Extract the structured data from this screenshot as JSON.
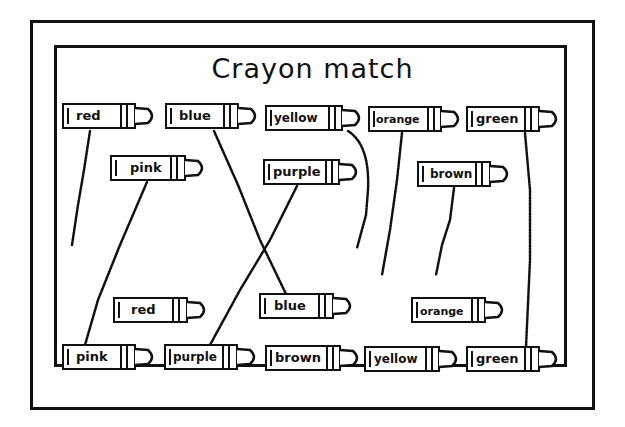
{
  "worksheet": {
    "title": "Crayon match",
    "top_row": [
      {
        "label": "red"
      },
      {
        "label": "blue"
      },
      {
        "label": "yellow"
      },
      {
        "label": "orange"
      },
      {
        "label": "green"
      }
    ],
    "second_row": [
      {
        "label": "pink"
      },
      {
        "label": "purple"
      },
      {
        "label": "brown"
      }
    ],
    "lower_row": [
      {
        "label": "red"
      },
      {
        "label": "blue"
      },
      {
        "label": "orange"
      }
    ],
    "bottom_row": [
      {
        "label": "pink"
      },
      {
        "label": "purple"
      },
      {
        "label": "brown"
      },
      {
        "label": "yellow"
      },
      {
        "label": "green"
      }
    ],
    "matches_drawn": [
      {
        "from": "blue (top)",
        "to": "blue (lower)",
        "complete": true
      },
      {
        "from": "pink (second)",
        "to": "pink (bottom)",
        "complete": true
      },
      {
        "from": "purple (second)",
        "to": "purple (bottom)",
        "complete": true
      },
      {
        "from": "green (top)",
        "to": "green (bottom)",
        "complete": true
      },
      {
        "from": "red (top)",
        "to": null,
        "complete": false
      },
      {
        "from": "yellow (top)",
        "to": null,
        "complete": false
      },
      {
        "from": "orange (top)",
        "to": null,
        "complete": false
      },
      {
        "from": "brown (second)",
        "to": null,
        "complete": false
      }
    ],
    "colors": {
      "ink": "#111111",
      "paper": "#ffffff"
    }
  }
}
